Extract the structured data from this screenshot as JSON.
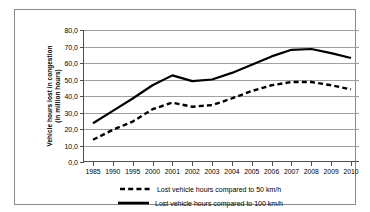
{
  "chart_data": {
    "type": "line",
    "title": "",
    "xlabel": "",
    "ylabel": "Vehicle hours lost in congestion (in million hours)",
    "ylabel_lines": [
      "Vehicle hours lost in congestion",
      "(in million hours)"
    ],
    "categories": [
      "1985",
      "1990",
      "1995",
      "2000",
      "2001",
      "2002",
      "2003",
      "2004",
      "2005",
      "2006",
      "2007",
      "2008",
      "2009",
      "2010"
    ],
    "ylim": [
      0,
      80
    ],
    "ytick_labels": [
      "0,0",
      "10,0",
      "20,0",
      "30,0",
      "40,0",
      "50,0",
      "60,0",
      "70,0",
      "80,0"
    ],
    "ytick_values": [
      0,
      10,
      20,
      30,
      40,
      50,
      60,
      70,
      80
    ],
    "grid": true,
    "legend_position": "bottom",
    "series": [
      {
        "name": "Lost vehicle hours compared to 50 km/h",
        "style": "dashed",
        "color": "#000000",
        "values": [
          13.5,
          19.5,
          24.5,
          32.0,
          36.0,
          33.5,
          34.5,
          38.5,
          43.0,
          46.5,
          48.5,
          48.5,
          46.5,
          44.0
        ]
      },
      {
        "name": "Lost vehicle hours compared to 100 km/h",
        "style": "solid",
        "color": "#000000",
        "values": [
          23.5,
          31.0,
          38.5,
          46.5,
          52.5,
          49.0,
          50.0,
          54.0,
          59.0,
          64.0,
          68.0,
          68.5,
          66.0,
          63.0
        ]
      }
    ]
  },
  "legend": [
    {
      "label": "Lost vehicle hours compared to 50 km/h",
      "style": "dashed"
    },
    {
      "label": "Lost vehicle hours compared to 100 km/h",
      "style": "solid"
    }
  ]
}
